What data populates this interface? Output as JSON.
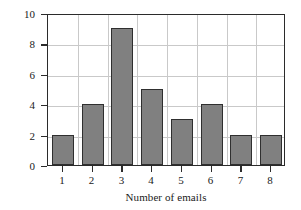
{
  "chart_data": {
    "type": "bar",
    "title": "",
    "subtitle": "",
    "categories": [
      "1",
      "2",
      "3",
      "4",
      "5",
      "6",
      "7",
      "8"
    ],
    "values": [
      2,
      4,
      9,
      5,
      3,
      4,
      2,
      2
    ],
    "xlabel": "Number of emails",
    "ylabel": "Frequency",
    "ylim": [
      0,
      10
    ],
    "y_ticks": [
      "0",
      "2",
      "4",
      "6",
      "8",
      "10"
    ],
    "y_tick_values": [
      0,
      2,
      4,
      6,
      8,
      10
    ],
    "x_ticks": [
      "1",
      "2",
      "3",
      "4",
      "5",
      "6",
      "7",
      "8"
    ],
    "grid": true,
    "grid_axis": "both",
    "legend": false,
    "legend_position": "none",
    "bar_color": "#808080",
    "bar_edge_color": "#2f2f2f",
    "grid_color": "#c9c9c9",
    "axis_color": "#2b2b2b",
    "background_color": "#ffffff"
  }
}
